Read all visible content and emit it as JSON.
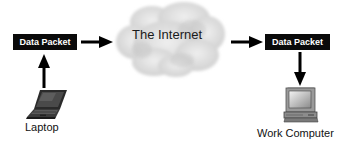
{
  "diagram": {
    "nodes": {
      "left_packet": {
        "label": "Data Packet"
      },
      "internet": {
        "label": "The Internet"
      },
      "right_packet": {
        "label": "Data Packet"
      },
      "laptop": {
        "label": "Laptop",
        "icon": "laptop-icon"
      },
      "work_computer": {
        "label": "Work Computer",
        "icon": "desktop-computer-icon"
      }
    },
    "edges": [
      {
        "from": "laptop",
        "to": "left_packet",
        "direction": "up"
      },
      {
        "from": "left_packet",
        "to": "internet",
        "direction": "right"
      },
      {
        "from": "internet",
        "to": "right_packet",
        "direction": "right"
      },
      {
        "from": "right_packet",
        "to": "work_computer",
        "direction": "down"
      }
    ],
    "colors": {
      "packet_bg": "#0a0a0a",
      "packet_text": "#ffffff",
      "cloud": "#d8d8d8",
      "arrow": "#000000"
    }
  }
}
